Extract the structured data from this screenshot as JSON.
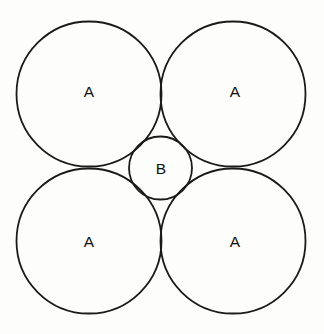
{
  "diagram": {
    "type": "circle-packing",
    "title": "",
    "canvas": {
      "width": 324,
      "height": 334,
      "background_color": "#fdfdfb"
    },
    "style": {
      "stroke_color": "#1a1a1a",
      "stroke_width": 1.8,
      "fill_color": "none",
      "label_color": "#111111"
    },
    "circles": [
      {
        "id": "circle-a-top-left",
        "label": "A",
        "cx": 89,
        "cy": 94,
        "r": 72.5,
        "label_x": 89,
        "label_y": 91,
        "size_class": "large"
      },
      {
        "id": "circle-a-top-right",
        "label": "A",
        "cx": 233,
        "cy": 94,
        "r": 72.5,
        "label_x": 235,
        "label_y": 91,
        "size_class": "large"
      },
      {
        "id": "circle-a-bottom-left",
        "label": "A",
        "cx": 89,
        "cy": 241,
        "r": 72.5,
        "label_x": 89,
        "label_y": 241,
        "size_class": "large"
      },
      {
        "id": "circle-a-bottom-right",
        "label": "A",
        "cx": 233,
        "cy": 241,
        "r": 72.5,
        "label_x": 235,
        "label_y": 241,
        "size_class": "large"
      },
      {
        "id": "circle-b-center",
        "label": "B",
        "cx": 160.5,
        "cy": 168,
        "r": 31.5,
        "label_x": 161,
        "label_y": 168,
        "size_class": "small"
      }
    ],
    "labels": {
      "large_circle_label": "A",
      "small_circle_label": "B"
    }
  }
}
